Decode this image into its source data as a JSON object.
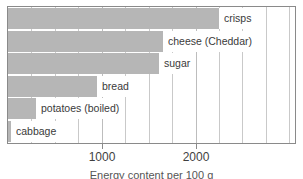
{
  "chart_data": {
    "type": "bar",
    "orientation": "horizontal",
    "title": "",
    "xlabel": "Energy content per 100 g",
    "ylabel": "",
    "categories": [
      "crisps",
      "cheese (Cheddar)",
      "sugar",
      "bread",
      "potatoes (boiled)",
      "cabbage"
    ],
    "values": [
      2250,
      1650,
      1610,
      950,
      300,
      30
    ],
    "xlim": [
      0,
      3060
    ],
    "xticks": [
      1000,
      2000
    ],
    "xticklabels": [
      "1000",
      "2000"
    ],
    "grid": true,
    "gridline_interval": 250,
    "legend": false,
    "bar_color": "#b6b6b6",
    "axis_color": "#8a8a8a",
    "gridline_color": "#c9c9c9"
  },
  "axis": {
    "ticks": [
      {
        "label": "1000",
        "value": 1000
      },
      {
        "label": "2000",
        "value": 2000
      }
    ]
  },
  "bars": [
    {
      "label": "crisps",
      "value": 2250
    },
    {
      "label": "cheese (Cheddar)",
      "value": 1650
    },
    {
      "label": "sugar",
      "value": 1610
    },
    {
      "label": "bread",
      "value": 950
    },
    {
      "label": "potatoes (boiled)",
      "value": 300
    },
    {
      "label": "cabbage",
      "value": 30
    }
  ],
  "caption": {
    "text": "Energy content per 100 g"
  }
}
